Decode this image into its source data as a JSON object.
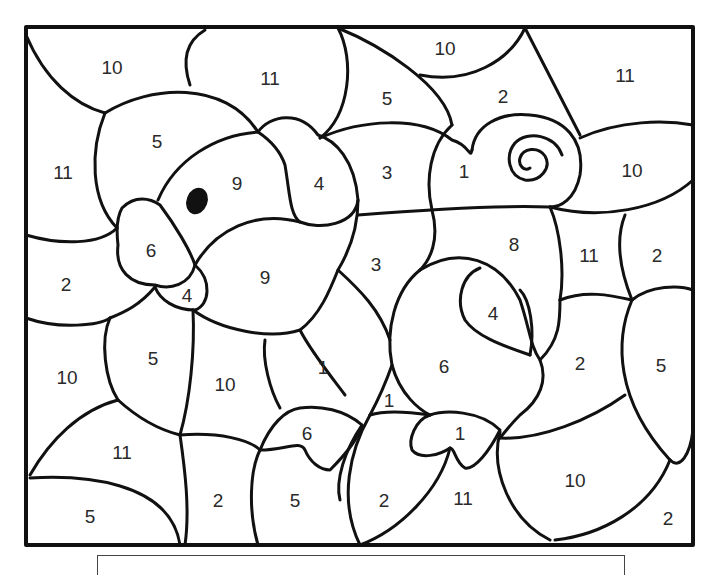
{
  "page": {
    "line_color": "#111111",
    "background": "#ffffff"
  },
  "regions": [
    {
      "id": "r1",
      "number": "10",
      "x": 112,
      "y": 67
    },
    {
      "id": "r2",
      "number": "11",
      "x": 270,
      "y": 78
    },
    {
      "id": "r3",
      "number": "10",
      "x": 445,
      "y": 48
    },
    {
      "id": "r4",
      "number": "11",
      "x": 625,
      "y": 75
    },
    {
      "id": "r5",
      "number": "5",
      "x": 387,
      "y": 98
    },
    {
      "id": "r6",
      "number": "2",
      "x": 503,
      "y": 96
    },
    {
      "id": "r7",
      "number": "5",
      "x": 157,
      "y": 141
    },
    {
      "id": "r8",
      "number": "11",
      "x": 63,
      "y": 172
    },
    {
      "id": "r9",
      "number": "9",
      "x": 237,
      "y": 183
    },
    {
      "id": "r10",
      "number": "4",
      "x": 319,
      "y": 183
    },
    {
      "id": "r11",
      "number": "3",
      "x": 387,
      "y": 172
    },
    {
      "id": "r12",
      "number": "1",
      "x": 464,
      "y": 171
    },
    {
      "id": "r13",
      "number": "10",
      "x": 632,
      "y": 170
    },
    {
      "id": "r14",
      "number": "6",
      "x": 151,
      "y": 250
    },
    {
      "id": "r15",
      "number": "8",
      "x": 514,
      "y": 244
    },
    {
      "id": "r16",
      "number": "11",
      "x": 589,
      "y": 255
    },
    {
      "id": "r17",
      "number": "2",
      "x": 657,
      "y": 255
    },
    {
      "id": "r18",
      "number": "2",
      "x": 66,
      "y": 284
    },
    {
      "id": "r19",
      "number": "9",
      "x": 265,
      "y": 277
    },
    {
      "id": "r20",
      "number": "3",
      "x": 376,
      "y": 264
    },
    {
      "id": "r21",
      "number": "4",
      "x": 187,
      "y": 295
    },
    {
      "id": "r22",
      "number": "4",
      "x": 493,
      "y": 313
    },
    {
      "id": "r23",
      "number": "5",
      "x": 153,
      "y": 358
    },
    {
      "id": "r24",
      "number": "10",
      "x": 67,
      "y": 377
    },
    {
      "id": "r25",
      "number": "10",
      "x": 225,
      "y": 384
    },
    {
      "id": "r26",
      "number": "1",
      "x": 323,
      "y": 367
    },
    {
      "id": "r27",
      "number": "6",
      "x": 444,
      "y": 366
    },
    {
      "id": "r28",
      "number": "2",
      "x": 580,
      "y": 363
    },
    {
      "id": "r29",
      "number": "5",
      "x": 661,
      "y": 365
    },
    {
      "id": "r30",
      "number": "1",
      "x": 389,
      "y": 400
    },
    {
      "id": "r31",
      "number": "6",
      "x": 307,
      "y": 433
    },
    {
      "id": "r32",
      "number": "1",
      "x": 460,
      "y": 433
    },
    {
      "id": "r33",
      "number": "11",
      "x": 122,
      "y": 452
    },
    {
      "id": "r34",
      "number": "10",
      "x": 575,
      "y": 480
    },
    {
      "id": "r35",
      "number": "2",
      "x": 218,
      "y": 500
    },
    {
      "id": "r36",
      "number": "5",
      "x": 295,
      "y": 500
    },
    {
      "id": "r37",
      "number": "2",
      "x": 384,
      "y": 500
    },
    {
      "id": "r38",
      "number": "11",
      "x": 463,
      "y": 498
    },
    {
      "id": "r39",
      "number": "5",
      "x": 90,
      "y": 516
    },
    {
      "id": "r40",
      "number": "2",
      "x": 668,
      "y": 518
    }
  ]
}
